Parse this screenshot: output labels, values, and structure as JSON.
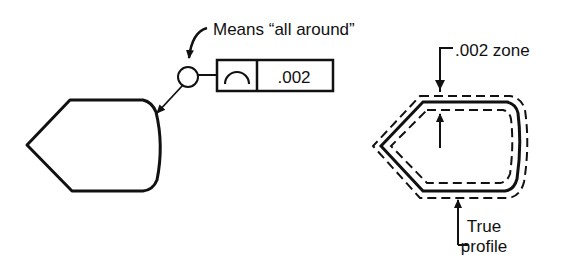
{
  "callouts": {
    "all_around": "Means “all around”",
    "zone": ".002 zone",
    "true_profile_line1": "True",
    "true_profile_line2": "profile"
  },
  "feature_control_frame": {
    "symbol": "profile-of-a-surface-icon",
    "tolerance": ".002"
  },
  "colors": {
    "ink": "#111111",
    "background": "#ffffff"
  }
}
